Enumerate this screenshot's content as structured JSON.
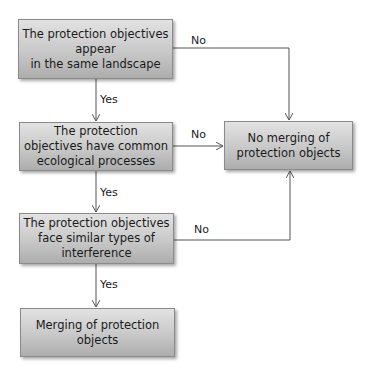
{
  "diagram": {
    "type": "flowchart",
    "nodes": [
      {
        "id": "q1",
        "text": "The protection objectives\nappear\nin the same landscape"
      },
      {
        "id": "q2",
        "text": "The protection\nobjectives have common\necological processes"
      },
      {
        "id": "q3",
        "text": "The protection objectives\nface similar types of\ninterference"
      },
      {
        "id": "yes_result",
        "text": "Merging of protection\nobjects"
      },
      {
        "id": "no_result",
        "text": "No merging of\nprotection objects"
      }
    ],
    "edges": [
      {
        "from": "q1",
        "to": "q2",
        "label": "Yes"
      },
      {
        "from": "q2",
        "to": "q3",
        "label": "Yes"
      },
      {
        "from": "q3",
        "to": "yes_result",
        "label": "Yes"
      },
      {
        "from": "q1",
        "to": "no_result",
        "label": "No"
      },
      {
        "from": "q2",
        "to": "no_result",
        "label": "No"
      },
      {
        "from": "q3",
        "to": "no_result",
        "label": "No"
      }
    ],
    "colors": {
      "box_fill_top": "#e2e2e2",
      "box_fill_bottom": "#adadad",
      "line": "#555555"
    }
  }
}
